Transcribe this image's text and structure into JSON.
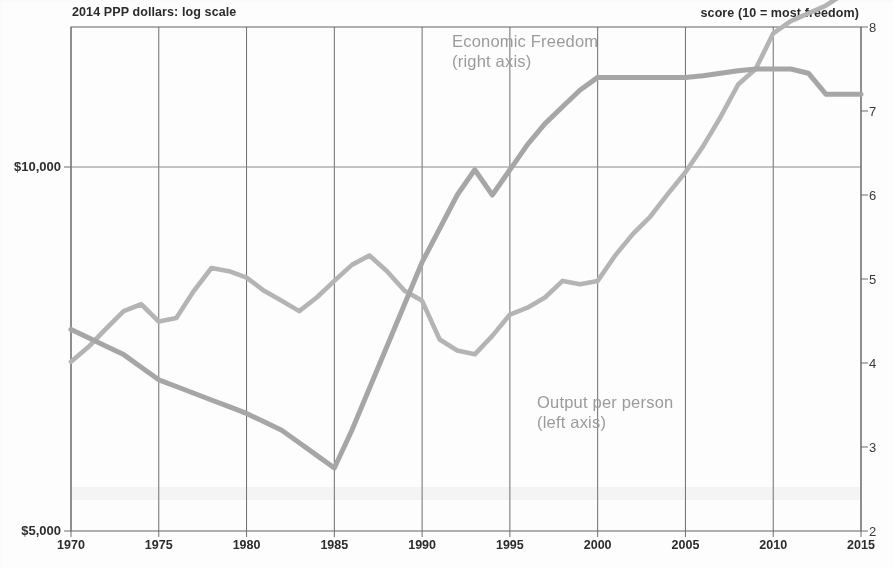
{
  "header": {
    "left_note": "2014 PPP dollars: log scale",
    "right_note": "score (10 = most freedom)"
  },
  "axes": {
    "left_ticks": [
      {
        "label": "$10,000",
        "value": 10000
      },
      {
        "label": "$5,000",
        "value": 5000
      }
    ],
    "right_ticks": [
      {
        "label": "8",
        "value": 8
      },
      {
        "label": "7",
        "value": 7
      },
      {
        "label": "6",
        "value": 6
      },
      {
        "label": "5",
        "value": 5
      },
      {
        "label": "4",
        "value": 4
      },
      {
        "label": "3",
        "value": 3
      },
      {
        "label": "2",
        "value": 2
      }
    ],
    "x_ticks": [
      "1970",
      "1975",
      "1980",
      "1985",
      "1990",
      "1995",
      "2000",
      "2005",
      "2010",
      "2015"
    ]
  },
  "annotations": [
    {
      "id": "freedom",
      "line1": "Economic Freedom",
      "line2": "(right axis)"
    },
    {
      "id": "output",
      "line1": "Output per person",
      "line2": "(left axis)"
    }
  ],
  "colors": {
    "economic_freedom_line": "#a6a6a6",
    "output_line": "#b4b4b4",
    "grid": "#6e6e6e",
    "gridline_horizontal": "#8a8a8a",
    "axis_text": "#2b2b2b",
    "annotation_text": "#9b9b9b",
    "plot_background": "#fdfdfd"
  },
  "chart_data": {
    "type": "line",
    "title": "",
    "subtitle": "",
    "xlabel": "",
    "ylabel": "2014 PPP dollars: log scale",
    "y2label": "score (10 = most freedom)",
    "xlim": [
      1970,
      2015
    ],
    "ylim": [
      5000,
      14500
    ],
    "y_scale": "log",
    "y2lim": [
      2,
      8
    ],
    "grid": true,
    "grid_vertical_interval": 5,
    "legend": "inline-annotations",
    "x": [
      1970,
      1971,
      1972,
      1973,
      1974,
      1975,
      1976,
      1977,
      1978,
      1979,
      1980,
      1981,
      1982,
      1983,
      1984,
      1985,
      1986,
      1987,
      1988,
      1989,
      1990,
      1991,
      1992,
      1993,
      1994,
      1995,
      1996,
      1997,
      1998,
      1999,
      2000,
      2001,
      2002,
      2003,
      2004,
      2005,
      2006,
      2007,
      2008,
      2009,
      2010,
      2011,
      2012,
      2013,
      2014,
      2015
    ],
    "series": [
      {
        "name": "Economic Freedom",
        "axis": "right",
        "units": "score (10 = most freedom)",
        "values": [
          4.4,
          4.3,
          4.2,
          4.1,
          3.95,
          3.8,
          3.72,
          3.64,
          3.56,
          3.48,
          3.4,
          3.3,
          3.2,
          3.05,
          2.9,
          2.75,
          3.2,
          3.7,
          4.2,
          4.7,
          5.2,
          5.6,
          6.0,
          6.3,
          6.0,
          6.3,
          6.6,
          6.85,
          7.05,
          7.25,
          7.4,
          7.4,
          7.4,
          7.4,
          7.4,
          7.4,
          7.42,
          7.45,
          7.48,
          7.5,
          7.5,
          7.5,
          7.45,
          7.2,
          7.2,
          7.2
        ]
      },
      {
        "name": "Output per person",
        "axis": "left",
        "units": "2014 PPP dollars",
        "values": [
          6900,
          7100,
          7350,
          7600,
          7700,
          7450,
          7500,
          7900,
          8250,
          8200,
          8100,
          7900,
          7750,
          7600,
          7800,
          8050,
          8300,
          8450,
          8200,
          7900,
          7750,
          7200,
          7050,
          7000,
          7250,
          7550,
          7650,
          7800,
          8050,
          8000,
          8050,
          8450,
          8800,
          9100,
          9500,
          9900,
          10400,
          11000,
          11700,
          12050,
          12900,
          13200,
          13400,
          13600,
          13900,
          14200
        ]
      }
    ],
    "annotations": [
      {
        "text": "Economic Freedom (right axis)",
        "x": 1991,
        "series": "Economic Freedom"
      },
      {
        "text": "Output per person (left axis)",
        "x": 2000,
        "series": "Output per person"
      }
    ]
  }
}
